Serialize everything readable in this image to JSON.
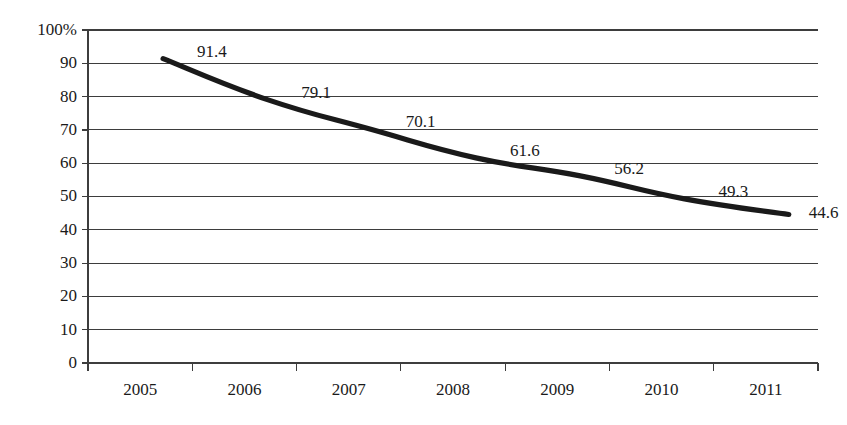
{
  "chart_data": {
    "type": "line",
    "title": "",
    "subtitle": "",
    "xlabel": "",
    "ylabel": "",
    "categories": [
      "2005",
      "2006",
      "2007",
      "2008",
      "2009",
      "2010",
      "2011"
    ],
    "x": [
      2005,
      2006,
      2007,
      2008,
      2009,
      2010,
      2011
    ],
    "values": [
      91.4,
      79.1,
      70.1,
      61.6,
      56.2,
      49.3,
      44.6
    ],
    "data_labels": [
      "91.4",
      "79.1",
      "70.1",
      "61.6",
      "56.2",
      "49.3",
      "44.6"
    ],
    "series": [
      {
        "name": "",
        "values": [
          91.4,
          79.1,
          70.1,
          61.6,
          56.2,
          49.3,
          44.6
        ]
      }
    ],
    "ylim": [
      0,
      100
    ],
    "ytick_values": [
      100,
      90,
      80,
      70,
      60,
      50,
      40,
      30,
      20,
      10,
      0
    ],
    "ytick_labels": [
      "100%",
      "90",
      "80",
      "70",
      "60",
      "50",
      "40",
      "30",
      "20",
      "10",
      "0"
    ],
    "xtick_labels": [
      "2005",
      "2006",
      "2007",
      "2008",
      "2009",
      "2010",
      "2011"
    ],
    "grid": true,
    "grid_axis": "y",
    "legend": false,
    "legend_position": "none",
    "colors": {
      "line": "#1a1a1a",
      "grid": "#3d3d3d",
      "axis": "#3d3d3d",
      "text": "#1a1a1a",
      "background": "#ffffff"
    },
    "label_offsets": [
      {
        "dx": 34,
        "dy": -6
      },
      {
        "dx": 34,
        "dy": -6
      },
      {
        "dx": 34,
        "dy": -6
      },
      {
        "dx": 34,
        "dy": -6
      },
      {
        "dx": 34,
        "dy": -6
      },
      {
        "dx": 34,
        "dy": -6
      },
      {
        "dx": 20,
        "dy": 0
      }
    ]
  }
}
